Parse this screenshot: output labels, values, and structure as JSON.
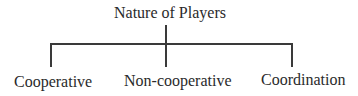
{
  "diagram": {
    "type": "tree",
    "root": {
      "label": "Nature of Players"
    },
    "children": [
      {
        "label": "Cooperative"
      },
      {
        "label": "Non-cooperative"
      },
      {
        "label": "Coordination"
      }
    ],
    "colors": {
      "line": "#3a3a3a",
      "text": "#2a2a2a",
      "background": "#ffffff"
    }
  }
}
